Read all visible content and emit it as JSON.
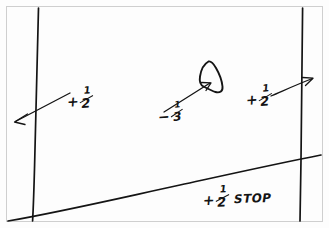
{
  "sketch": {
    "medium": "hand-drawn ink on white",
    "background_color": "#fdfdfd",
    "ink_color": "#141414",
    "frame_color": "#cfcfcf"
  },
  "annotations": {
    "left": {
      "sign": "+",
      "numerator": "1",
      "denominator": "2",
      "full_text": "+1/2"
    },
    "center": {
      "sign": "−",
      "numerator": "1",
      "denominator": "3",
      "full_text": "-1/3"
    },
    "right": {
      "sign": "+",
      "numerator": "1",
      "denominator": "2",
      "full_text": "+1/2"
    },
    "bottom": {
      "sign": "+",
      "numerator": "1",
      "denominator": "2",
      "unit": "STOP",
      "full_text": "+1/2 STOP"
    }
  },
  "shapes": {
    "left_vertical_label": "vertical-line-left",
    "right_vertical_label": "vertical-line-right",
    "diagonal_label": "diagonal-line",
    "blob_label": "blob-subject",
    "arrow_left_label": "arrow-left",
    "arrow_center_label": "arrow-center",
    "arrow_right_label": "arrow-right"
  }
}
